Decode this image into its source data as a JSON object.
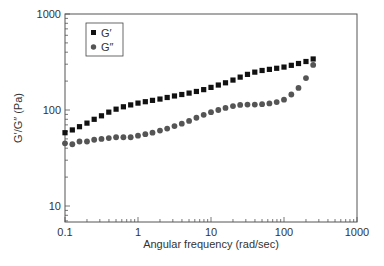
{
  "chart_data": {
    "type": "scatter",
    "title": "",
    "xlabel": "Angular frequency (rad/sec)",
    "ylabel": "G′/G″ (Pa)",
    "xscale": "log",
    "yscale": "log",
    "xlim": [
      0.1,
      1000
    ],
    "ylim": [
      6.8,
      1000
    ],
    "xticks": [
      0.1,
      1,
      10,
      100,
      1000
    ],
    "xtick_labels": [
      "0.1",
      "1",
      "10",
      "100",
      "1000"
    ],
    "yticks": [
      10,
      100,
      1000
    ],
    "ytick_labels": [
      "10",
      "100",
      "1000"
    ],
    "grid": false,
    "legend_position": "upper left",
    "series": [
      {
        "name": "G′",
        "marker": "square",
        "color": "#111111",
        "x": [
          0.1,
          0.126,
          0.158,
          0.2,
          0.251,
          0.316,
          0.398,
          0.501,
          0.631,
          0.794,
          1,
          1.26,
          1.58,
          2,
          2.51,
          3.16,
          3.98,
          5.01,
          6.31,
          7.94,
          10,
          12.6,
          15.8,
          20,
          25.1,
          31.6,
          39.8,
          50.1,
          63.1,
          79.4,
          100,
          126,
          158,
          200,
          251
        ],
        "values": [
          58,
          62,
          67,
          73,
          80,
          87,
          95,
          102,
          108,
          113,
          118,
          122,
          126,
          130,
          135,
          140,
          145,
          150,
          156,
          163,
          172,
          182,
          192,
          205,
          220,
          235,
          248,
          258,
          265,
          272,
          280,
          292,
          305,
          320,
          340
        ]
      },
      {
        "name": "G″",
        "marker": "circle",
        "color": "#555555",
        "x": [
          0.1,
          0.126,
          0.158,
          0.2,
          0.251,
          0.316,
          0.398,
          0.501,
          0.631,
          0.794,
          1,
          1.26,
          1.58,
          2,
          2.51,
          3.16,
          3.98,
          5.01,
          6.31,
          7.94,
          10,
          12.6,
          15.8,
          20,
          25.1,
          31.6,
          39.8,
          50.1,
          63.1,
          79.4,
          100,
          126,
          158,
          200,
          251
        ],
        "values": [
          45,
          44,
          47,
          47,
          49,
          50,
          51,
          52,
          52,
          52,
          54,
          56,
          58,
          61,
          64,
          68,
          72,
          77,
          83,
          89,
          95,
          100,
          105,
          110,
          113,
          114,
          114,
          115,
          117,
          121,
          128,
          145,
          170,
          215,
          295
        ]
      }
    ]
  }
}
